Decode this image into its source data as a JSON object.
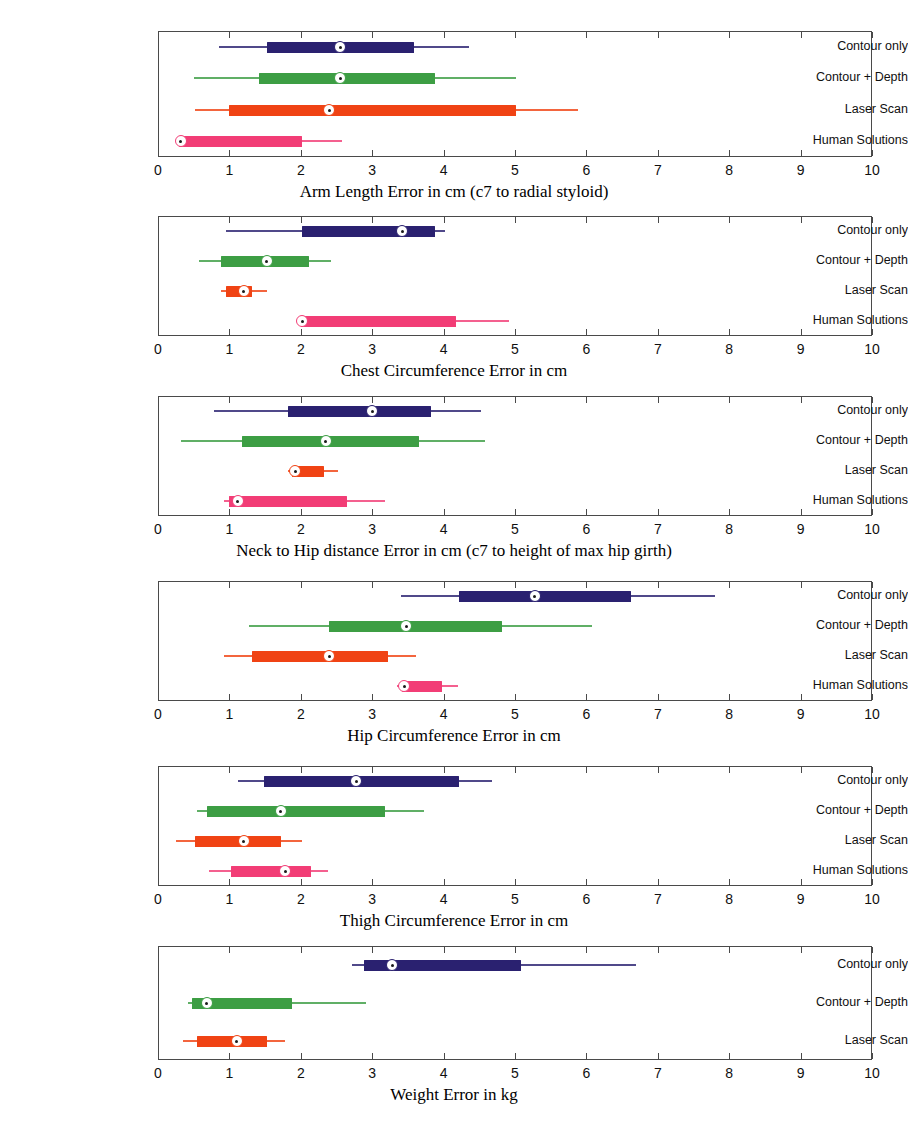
{
  "figure": {
    "type": "box-plot-grid",
    "x_axis": {
      "min": 0,
      "max": 10,
      "ticks": [
        0,
        1,
        2,
        3,
        4,
        5,
        6,
        7,
        8,
        9,
        10
      ],
      "tick_labels": [
        "0",
        "1",
        "2",
        "3",
        "4",
        "5",
        "6",
        "7",
        "8",
        "9",
        "10"
      ]
    },
    "series_colors": {
      "Contour only": "#2a2170",
      "Contour + Depth": "#3d9e44",
      "Laser Scan": "#f04314",
      "Human Solutions": "#f23d76"
    },
    "row_labels": [
      "Contour only",
      "Contour + Depth",
      "Laser Scan",
      "Human Solutions"
    ]
  },
  "chart_data": [
    {
      "type": "box",
      "title": "Arm Length Error in cm (c7 to radial styloid)",
      "xlabel": "Arm Length Error in cm (c7 to radial styloid)",
      "ylabel": "",
      "xlim": [
        0,
        10
      ],
      "grid": false,
      "legend": "none",
      "categories": [
        "Contour only",
        "Contour + Depth",
        "Laser Scan",
        "Human Solutions"
      ],
      "boxes": [
        {
          "name": "Contour only",
          "color": "#2a2170",
          "whisker_low": 0.85,
          "q1": 1.52,
          "median": 2.55,
          "q3": 3.58,
          "whisker_high": 4.35
        },
        {
          "name": "Contour + Depth",
          "color": "#3d9e44",
          "whisker_low": 0.5,
          "q1": 1.42,
          "median": 2.55,
          "q3": 3.88,
          "whisker_high": 5.02
        },
        {
          "name": "Laser Scan",
          "color": "#f04314",
          "whisker_low": 0.52,
          "q1": 1.0,
          "median": 2.4,
          "q3": 5.02,
          "whisker_high": 5.88
        },
        {
          "name": "Human Solutions",
          "color": "#f23d76",
          "whisker_low": 0.28,
          "q1": 0.3,
          "median": 0.32,
          "q3": 2.02,
          "whisker_high": 2.58
        }
      ]
    },
    {
      "type": "box",
      "title": "Chest Circumference Error in cm",
      "xlabel": "Chest Circumference Error in cm",
      "ylabel": "",
      "xlim": [
        0,
        10
      ],
      "grid": false,
      "legend": "none",
      "categories": [
        "Contour only",
        "Contour + Depth",
        "Laser Scan",
        "Human Solutions"
      ],
      "boxes": [
        {
          "name": "Contour only",
          "color": "#2a2170",
          "whisker_low": 0.95,
          "q1": 2.02,
          "median": 3.42,
          "q3": 3.88,
          "whisker_high": 4.02
        },
        {
          "name": "Contour + Depth",
          "color": "#3d9e44",
          "whisker_low": 0.58,
          "q1": 0.88,
          "median": 1.52,
          "q3": 2.12,
          "whisker_high": 2.42
        },
        {
          "name": "Laser Scan",
          "color": "#f04314",
          "whisker_low": 0.88,
          "q1": 0.95,
          "median": 1.2,
          "q3": 1.32,
          "whisker_high": 1.52
        },
        {
          "name": "Human Solutions",
          "color": "#f23d76",
          "whisker_low": 1.98,
          "q1": 2.0,
          "median": 2.02,
          "q3": 4.18,
          "whisker_high": 4.92
        }
      ]
    },
    {
      "type": "box",
      "title": "Neck to Hip distance Error in cm (c7 to height of max hip girth)",
      "xlabel": "Neck to Hip distance Error in cm (c7 to height of max hip girth)",
      "ylabel": "",
      "xlim": [
        0,
        10
      ],
      "grid": false,
      "legend": "none",
      "categories": [
        "Contour only",
        "Contour + Depth",
        "Laser Scan",
        "Human Solutions"
      ],
      "boxes": [
        {
          "name": "Contour only",
          "color": "#2a2170",
          "whisker_low": 0.78,
          "q1": 1.82,
          "median": 3.0,
          "q3": 3.82,
          "whisker_high": 4.52
        },
        {
          "name": "Contour + Depth",
          "color": "#3d9e44",
          "whisker_low": 0.32,
          "q1": 1.18,
          "median": 2.35,
          "q3": 3.65,
          "whisker_high": 4.58
        },
        {
          "name": "Laser Scan",
          "color": "#f04314",
          "whisker_low": 1.82,
          "q1": 1.88,
          "median": 1.92,
          "q3": 2.32,
          "whisker_high": 2.52
        },
        {
          "name": "Human Solutions",
          "color": "#f23d76",
          "whisker_low": 0.92,
          "q1": 1.0,
          "median": 1.12,
          "q3": 2.65,
          "whisker_high": 3.18
        }
      ]
    },
    {
      "type": "box",
      "title": "Hip Circumference Error in cm",
      "xlabel": "Hip Circumference Error in cm",
      "ylabel": "",
      "xlim": [
        0,
        10
      ],
      "grid": false,
      "legend": "none",
      "categories": [
        "Contour only",
        "Contour + Depth",
        "Laser Scan",
        "Human Solutions"
      ],
      "boxes": [
        {
          "name": "Contour only",
          "color": "#2a2170",
          "whisker_low": 3.4,
          "q1": 4.22,
          "median": 5.28,
          "q3": 6.62,
          "whisker_high": 7.8
        },
        {
          "name": "Contour + Depth",
          "color": "#3d9e44",
          "whisker_low": 1.28,
          "q1": 2.4,
          "median": 3.48,
          "q3": 4.82,
          "whisker_high": 6.08
        },
        {
          "name": "Laser Scan",
          "color": "#f04314",
          "whisker_low": 0.92,
          "q1": 1.32,
          "median": 2.4,
          "q3": 3.22,
          "whisker_high": 3.62
        },
        {
          "name": "Human Solutions",
          "color": "#f23d76",
          "whisker_low": 3.35,
          "q1": 3.42,
          "median": 3.45,
          "q3": 3.98,
          "whisker_high": 4.2
        }
      ]
    },
    {
      "type": "box",
      "title": "Thigh Circumference Error in cm",
      "xlabel": "Thigh Circumference Error in cm",
      "ylabel": "",
      "xlim": [
        0,
        10
      ],
      "grid": false,
      "legend": "none",
      "categories": [
        "Contour only",
        "Contour + Depth",
        "Laser Scan",
        "Human Solutions"
      ],
      "boxes": [
        {
          "name": "Contour only",
          "color": "#2a2170",
          "whisker_low": 1.12,
          "q1": 1.48,
          "median": 2.78,
          "q3": 4.22,
          "whisker_high": 4.68
        },
        {
          "name": "Contour + Depth",
          "color": "#3d9e44",
          "whisker_low": 0.55,
          "q1": 0.68,
          "median": 1.72,
          "q3": 3.18,
          "whisker_high": 3.72
        },
        {
          "name": "Laser Scan",
          "color": "#f04314",
          "whisker_low": 0.25,
          "q1": 0.52,
          "median": 1.2,
          "q3": 1.72,
          "whisker_high": 2.02
        },
        {
          "name": "Human Solutions",
          "color": "#f23d76",
          "whisker_low": 0.72,
          "q1": 1.02,
          "median": 1.78,
          "q3": 2.15,
          "whisker_high": 2.38
        }
      ]
    },
    {
      "type": "box",
      "title": "Weight Error in kg",
      "xlabel": "Weight Error in kg",
      "ylabel": "",
      "xlim": [
        0,
        10
      ],
      "grid": false,
      "legend": "none",
      "categories": [
        "Contour only",
        "Contour + Depth",
        "Laser Scan"
      ],
      "boxes": [
        {
          "name": "Contour only",
          "color": "#2a2170",
          "whisker_low": 2.72,
          "q1": 2.88,
          "median": 3.28,
          "q3": 5.08,
          "whisker_high": 6.7
        },
        {
          "name": "Contour + Depth",
          "color": "#3d9e44",
          "whisker_low": 0.42,
          "q1": 0.48,
          "median": 0.68,
          "q3": 1.88,
          "whisker_high": 2.92
        },
        {
          "name": "Laser Scan",
          "color": "#f04314",
          "whisker_low": 0.35,
          "q1": 0.55,
          "median": 1.1,
          "q3": 1.52,
          "whisker_high": 1.78
        }
      ]
    }
  ]
}
